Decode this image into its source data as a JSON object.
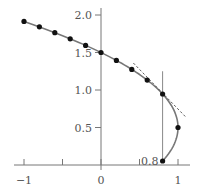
{
  "chart_data": {
    "type": "scatter",
    "title": "",
    "xlabel": "",
    "ylabel": "",
    "xlim": [
      -1.1,
      1.1
    ],
    "ylim": [
      0,
      2.1
    ],
    "grid": false,
    "legend": null,
    "x_ticks": [
      {
        "value": -1,
        "label": "−1"
      },
      {
        "value": -0.5,
        "label": ""
      },
      {
        "value": 0,
        "label": "0"
      },
      {
        "value": 0.5,
        "label": ""
      },
      {
        "value": 1,
        "label": "1"
      }
    ],
    "y_ticks": [
      {
        "value": 0.5,
        "label": "0.5"
      },
      {
        "value": 1.0,
        "label": "1.0"
      },
      {
        "value": 1.5,
        "label": "1.5"
      },
      {
        "value": 2.0,
        "label": "2.0"
      }
    ],
    "series": [
      {
        "name": "curve x = 1 - (y - 0.5)^2",
        "style": "solid",
        "color": "#777777"
      },
      {
        "name": "points",
        "style": "markers",
        "color": "#111111",
        "points": [
          {
            "x": -1.0,
            "y": 1.914
          },
          {
            "x": -0.8,
            "y": 1.842
          },
          {
            "x": -0.6,
            "y": 1.765
          },
          {
            "x": -0.4,
            "y": 1.683
          },
          {
            "x": -0.2,
            "y": 1.595
          },
          {
            "x": 0.0,
            "y": 1.5
          },
          {
            "x": 0.2,
            "y": 1.394
          },
          {
            "x": 0.4,
            "y": 1.275
          },
          {
            "x": 0.6,
            "y": 1.132
          },
          {
            "x": 0.8,
            "y": 0.947
          },
          {
            "x": 1.0,
            "y": 0.5
          },
          {
            "x": 0.8,
            "y": 0.053
          }
        ]
      },
      {
        "name": "tangent at (0.8, 0.947)",
        "style": "dashed",
        "color": "#333333",
        "from": {
          "x": 0.42,
          "y": 1.36
        },
        "to": {
          "x": 1.11,
          "y": 0.63
        }
      },
      {
        "name": "vertical line x = 0.8",
        "style": "solid",
        "color": "#777777",
        "from": {
          "x": 0.8,
          "y": 1.25
        },
        "to": {
          "x": 0.8,
          "y": 0.053
        }
      }
    ],
    "annotations": [
      {
        "text": "0.8",
        "x": 0.8,
        "y": 0.053,
        "position": "left"
      }
    ]
  }
}
